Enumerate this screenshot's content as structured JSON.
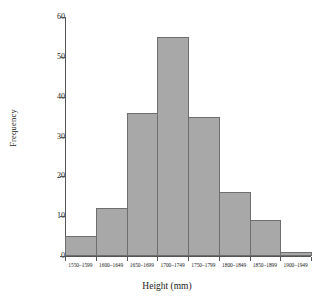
{
  "chart_data": {
    "type": "bar",
    "title": "",
    "subtitle": "",
    "xlabel": "Height (mm)",
    "ylabel": "Frequency",
    "categories": [
      "1550–1599",
      "1600–1649",
      "1650–1699",
      "1700–1749",
      "1750–1799",
      "1800–1849",
      "1850–1899",
      "1900–1949"
    ],
    "values": [
      5,
      12,
      36,
      55,
      35,
      16,
      9,
      1
    ],
    "ylim": [
      0,
      60
    ],
    "yticks": [
      0,
      10,
      20,
      30,
      40,
      50,
      60
    ],
    "ytick_labels": [
      "0",
      "10",
      "20",
      "30",
      "40",
      "50",
      "60"
    ],
    "grid": false,
    "legend": null,
    "bar_fill_color": "#a8a8a8",
    "bar_border_color": "#6e6e6e",
    "axis_color": "#555555",
    "background_color": "#ffffff"
  }
}
